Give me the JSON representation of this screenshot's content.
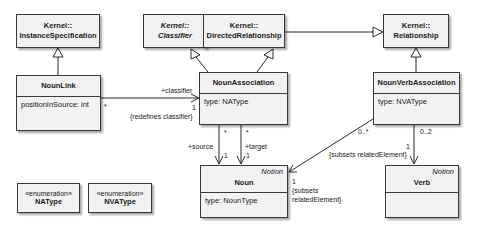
{
  "classes": {
    "instance_spec": {
      "line1": "Kernel::",
      "line2": "InstanceSpecification"
    },
    "classifier": {
      "line1": "Kernel::",
      "line2": "Classifier"
    },
    "directed_rel": {
      "line1": "Kernel::",
      "line2": "DirectedRelationship"
    },
    "relationship": {
      "line1": "Kernel::",
      "line2": "Relationship"
    },
    "noun_link": {
      "name": "NounLink",
      "attr": "positionInSource:  int"
    },
    "noun_association": {
      "name": "NounAssociation",
      "attr": "type:  NAType"
    },
    "noun_verb_association": {
      "name": "NounVerbAssociation",
      "attr": "type:  NVAType"
    },
    "noun": {
      "stereotype": "Notion",
      "name": "Noun",
      "attr": "type:  NounType"
    },
    "verb": {
      "stereotype": "Notion",
      "name": "Verb"
    },
    "na_type": {
      "stereotype": "«enumeration»",
      "name": "NAType"
    },
    "nva_type": {
      "stereotype": "«enumeration»",
      "name": "NVAType"
    }
  },
  "labels": {
    "link_star": "*",
    "classifier_role": "+classifier",
    "classifier_mult": "1",
    "redefines": "{redefines classifier}",
    "source_star": "*",
    "target_star": "*",
    "source_role": "+source",
    "target_role": "+target",
    "source_mult": "1",
    "target_mult": "1",
    "nva_noun_mult": "0..*",
    "noun_end_mult": "1",
    "noun_subsets_1": "{subsets",
    "noun_subsets_2": "relatedElement}",
    "nva_verb_mult": "0..2",
    "verb_end_mult": "1",
    "verb_subsets": "{subsets relatedElement}"
  }
}
